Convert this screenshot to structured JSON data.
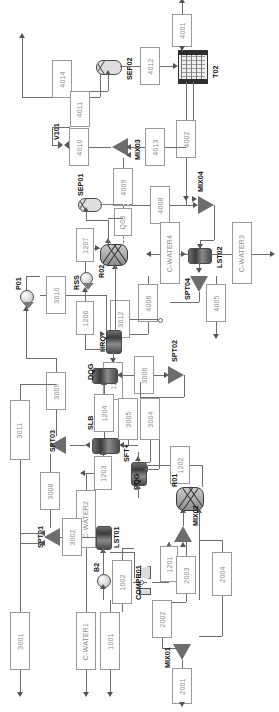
{
  "diagram": {
    "orientation": "rotated-90",
    "stroke_color": "#6e6e6e",
    "label_color": "#8d8d8d",
    "equipment_color": "#4a4a4a"
  },
  "streams": [
    {
      "id": "s4014",
      "label": "4014"
    },
    {
      "id": "s4012",
      "label": "4012"
    },
    {
      "id": "s4011",
      "label": "4011"
    },
    {
      "id": "s4010",
      "label": "4010"
    },
    {
      "id": "s4013",
      "label": "4013"
    },
    {
      "id": "s4001",
      "label": "4001"
    },
    {
      "id": "s4002",
      "label": "4002"
    },
    {
      "id": "s4009",
      "label": "4009"
    },
    {
      "id": "s4008",
      "label": "4008"
    },
    {
      "id": "s4006",
      "label": "4006"
    },
    {
      "id": "s4005",
      "label": "4005"
    },
    {
      "id": "s1207",
      "label": "1207"
    },
    {
      "id": "s1206",
      "label": "1206"
    },
    {
      "id": "s1205",
      "label": "1205"
    },
    {
      "id": "s1204",
      "label": "1204"
    },
    {
      "id": "s1203",
      "label": "1203"
    },
    {
      "id": "s1202",
      "label": "1202"
    },
    {
      "id": "s1201",
      "label": "1201"
    },
    {
      "id": "s1002",
      "label": "1002"
    },
    {
      "id": "s1001",
      "label": "1001"
    },
    {
      "id": "s3012",
      "label": "3012"
    },
    {
      "id": "s3011",
      "label": "3011"
    },
    {
      "id": "s3010",
      "label": "3010"
    },
    {
      "id": "s3009",
      "label": "3009"
    },
    {
      "id": "s3008",
      "label": "3008"
    },
    {
      "id": "s3006",
      "label": "3006"
    },
    {
      "id": "s3005",
      "label": "3005"
    },
    {
      "id": "s3004",
      "label": "3004"
    },
    {
      "id": "s3003",
      "label": "3003"
    },
    {
      "id": "s3002",
      "label": "3002"
    },
    {
      "id": "s3001",
      "label": "3001"
    },
    {
      "id": "s2004",
      "label": "2004"
    },
    {
      "id": "s2003",
      "label": "2003"
    },
    {
      "id": "s2002",
      "label": "2002"
    },
    {
      "id": "s2001",
      "label": "2001"
    },
    {
      "id": "cw1",
      "label": "C-WATER1"
    },
    {
      "id": "cw2",
      "label": "C-WATER2"
    },
    {
      "id": "cw3",
      "label": "C-WATER3"
    },
    {
      "id": "cw4",
      "label": "C-WATER4"
    }
  ],
  "equipment": [
    {
      "id": "sep02",
      "label": "SEP02",
      "type": "separator"
    },
    {
      "id": "sep01",
      "label": "SEP01",
      "type": "separator"
    },
    {
      "id": "t02",
      "label": "T02",
      "type": "column"
    },
    {
      "id": "v101",
      "label": "V101",
      "type": "valve"
    },
    {
      "id": "mix03",
      "label": "MIX03",
      "type": "mixer"
    },
    {
      "id": "mix04",
      "label": "MIX04",
      "type": "mixer"
    },
    {
      "id": "mix02",
      "label": "MIX02",
      "type": "mixer"
    },
    {
      "id": "mix01",
      "label": "MIX01",
      "type": "mixer"
    },
    {
      "id": "lst02",
      "label": "LST02",
      "type": "heat-exchanger"
    },
    {
      "id": "lst01",
      "label": "LST01",
      "type": "heat-exchanger"
    },
    {
      "id": "spt04",
      "label": "SPT04",
      "type": "splitter"
    },
    {
      "id": "spt03",
      "label": "SPT03",
      "type": "splitter"
    },
    {
      "id": "spt02",
      "label": "SPT02",
      "type": "splitter"
    },
    {
      "id": "spt01",
      "label": "SPT01",
      "type": "splitter"
    },
    {
      "id": "r02",
      "label": "R02",
      "type": "reactor"
    },
    {
      "id": "r01",
      "label": "R01",
      "type": "reactor"
    },
    {
      "id": "q03",
      "label": "Q03",
      "type": "heat-duty"
    },
    {
      "id": "rss",
      "label": "RSS",
      "type": "pump"
    },
    {
      "id": "p01",
      "label": "P01",
      "type": "pump"
    },
    {
      "id": "b2",
      "label": "B2",
      "type": "pump"
    },
    {
      "id": "hrq",
      "label": "HRQ",
      "type": "heat-exchanger"
    },
    {
      "id": "dqg_top",
      "label": "DQG",
      "type": "heat-exchanger"
    },
    {
      "id": "dqg_bot",
      "label": "DQG",
      "type": "heat-exchanger"
    },
    {
      "id": "slb",
      "label": "SLB",
      "type": "heat-exchanger"
    },
    {
      "id": "sft",
      "label": "SFT+",
      "type": "heat-exchanger"
    },
    {
      "id": "compr01",
      "label": "COMPR01",
      "type": "compressor"
    }
  ]
}
